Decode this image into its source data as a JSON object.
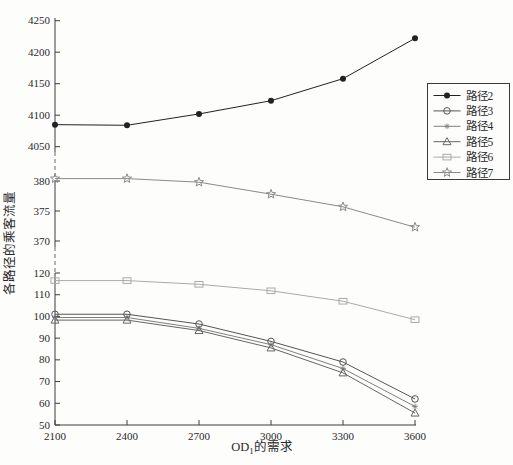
{
  "figure": {
    "background": "#fdfdfc",
    "axis_color": "#3c3c3c",
    "x_axis": {
      "label_base": "OD",
      "label_sub": "1",
      "label_rest": "的需求",
      "ticks": [
        "2100",
        "2400",
        "2700",
        "3000",
        "3300",
        "3600"
      ]
    },
    "y_axis": {
      "label": "各路径的乘客流量",
      "segments": [
        {
          "ticks": [
            "50",
            "60",
            "70",
            "80",
            "90",
            "100",
            "110",
            "120"
          ]
        },
        {
          "ticks": [
            "370",
            "375",
            "380"
          ]
        },
        {
          "ticks": [
            "4050",
            "4100",
            "4150",
            "4200",
            "4250"
          ]
        }
      ],
      "break_style": "dashed"
    }
  },
  "chart_data": {
    "type": "line",
    "title": "",
    "xlabel": "OD1的需求",
    "ylabel": "各路径的乘客流量",
    "x": [
      2100,
      2400,
      2700,
      3000,
      3300,
      3600
    ],
    "broken_y_axis_ranges": [
      [
        50,
        120
      ],
      [
        370,
        382
      ],
      [
        4050,
        4250
      ]
    ],
    "grid": false,
    "series": [
      {
        "name": "路径2",
        "marker": "filled-circle",
        "color": "#222222",
        "values": [
          4085,
          4084,
          4102,
          4123,
          4158,
          4222
        ]
      },
      {
        "name": "路径3",
        "marker": "open-circle",
        "color": "#555555",
        "values": [
          101,
          101,
          96.5,
          88.5,
          79,
          62
        ]
      },
      {
        "name": "路径4",
        "marker": "asterisk",
        "color": "#808080",
        "values": [
          99.5,
          99.5,
          94.5,
          87,
          76,
          58.5
        ]
      },
      {
        "name": "路径5",
        "marker": "open-triangle",
        "color": "#666666",
        "values": [
          98.3,
          98.3,
          93.5,
          85.5,
          74,
          55.5
        ]
      },
      {
        "name": "路径6",
        "marker": "open-square",
        "color": "#aaaaaa",
        "values": [
          116.5,
          116.5,
          114.8,
          111.8,
          107,
          98.5
        ]
      },
      {
        "name": "路径7",
        "marker": "open-star",
        "color": "#8a8a8a",
        "values": [
          380.4,
          380.4,
          379.8,
          377.8,
          375.7,
          372.3
        ]
      }
    ],
    "legend": {
      "position": "right",
      "entries": [
        "路径2",
        "路径3",
        "路径4",
        "路径5",
        "路径6",
        "路径7"
      ]
    }
  }
}
